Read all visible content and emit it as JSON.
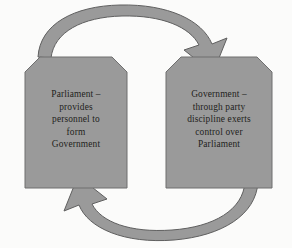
{
  "diagram": {
    "type": "cycle-diagram",
    "background_color": "#fbfbfa",
    "node_fill_color": "#9a9a9a",
    "node_stroke_color": "#6f6f6f",
    "arrow_fill_color": "#9a9a9a",
    "arrow_stroke_color": "#5f5f5f",
    "text_color": "#231f20",
    "nodes": [
      {
        "id": "parliament",
        "label": "Parliament –\nprovides\npersonnel to\nform\nGovernment",
        "lines": [
          "Parliament –",
          "provides",
          "personnel to",
          "form",
          "Government"
        ],
        "position": "left"
      },
      {
        "id": "government",
        "label": "Government –\nthrough party\ndiscipline exerts\ncontrol over\nParliament",
        "lines": [
          "Government –",
          "through party",
          "discipline exerts",
          "control over",
          "Parliament"
        ],
        "position": "right"
      }
    ],
    "arrows": [
      {
        "id": "top-arrow",
        "from": "parliament",
        "to": "government",
        "direction": "clockwise-top",
        "description": "curved arrow from Parliament over the top into Government"
      },
      {
        "id": "bottom-arrow",
        "from": "government",
        "to": "parliament",
        "direction": "clockwise-bottom",
        "description": "curved arrow from Government under the bottom into Parliament"
      }
    ]
  }
}
